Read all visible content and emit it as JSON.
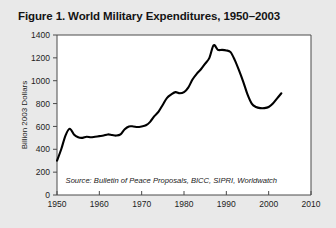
{
  "figure": {
    "title": "Figure 1. World Military Expenditures, 1950–2003",
    "source_note": "Source: Bulletin of Peace Proposals, BICC, SIPRI, Worldwatch"
  },
  "colors": {
    "page_background": "#e9e9e9",
    "plot_background": "#ffffff",
    "line": "#000000",
    "axis": "#4a4a4a",
    "text": "#1d1d1d"
  },
  "chart_data": {
    "type": "line",
    "title": "Figure 1. World Military Expenditures, 1950–2003",
    "xlabel": "",
    "ylabel": "Billion 2003 Dollars",
    "xlim": [
      1950,
      2010
    ],
    "ylim": [
      0,
      1400
    ],
    "xticks": [
      1950,
      1960,
      1970,
      1980,
      1990,
      2000,
      2010
    ],
    "yticks": [
      0,
      200,
      400,
      600,
      800,
      1000,
      1200,
      1400
    ],
    "xtick_labels": [
      "1950",
      "1960",
      "1970",
      "1980",
      "1990",
      "2000",
      "2010"
    ],
    "ytick_labels": [
      "0",
      "200",
      "400",
      "600",
      "800",
      "1000",
      "1200",
      "1400"
    ],
    "grid": false,
    "legend": "none",
    "annotations": [
      {
        "text": "Source: Bulletin of Peace Proposals, BICC, SIPRI, Worldwatch",
        "x": 1977,
        "y": 105
      }
    ],
    "series": [
      {
        "name": "World Military Expenditures",
        "x": [
          1950,
          1951,
          1952,
          1953,
          1954,
          1955,
          1956,
          1957,
          1958,
          1959,
          1960,
          1961,
          1962,
          1963,
          1964,
          1965,
          1966,
          1967,
          1968,
          1969,
          1970,
          1971,
          1972,
          1973,
          1974,
          1975,
          1976,
          1977,
          1978,
          1979,
          1980,
          1981,
          1982,
          1983,
          1984,
          1985,
          1986,
          1987,
          1988,
          1989,
          1990,
          1991,
          1992,
          1993,
          1994,
          1995,
          1996,
          1997,
          1998,
          1999,
          2000,
          2001,
          2002,
          2003
        ],
        "values": [
          300,
          400,
          520,
          580,
          530,
          505,
          500,
          510,
          505,
          510,
          515,
          520,
          530,
          525,
          520,
          530,
          575,
          600,
          600,
          595,
          600,
          610,
          640,
          690,
          730,
          790,
          850,
          880,
          900,
          890,
          900,
          940,
          1010,
          1060,
          1100,
          1150,
          1200,
          1310,
          1270,
          1270,
          1265,
          1250,
          1180,
          1090,
          990,
          880,
          800,
          770,
          760,
          760,
          770,
          800,
          845,
          890
        ]
      }
    ]
  }
}
